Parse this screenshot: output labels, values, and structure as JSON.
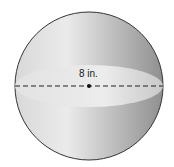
{
  "figure": {
    "shape": "sphere",
    "diameter_label": "8 in.",
    "colors": {
      "outline": "#333333",
      "fill_light": "#e8e8e8",
      "fill_dark": "#9a9a9a",
      "equator": "#dedede",
      "dashed_line": "#222222"
    }
  }
}
